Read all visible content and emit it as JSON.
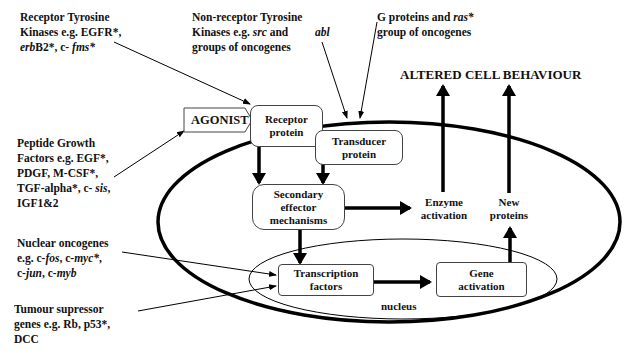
{
  "title": "ALTERED CELL BEHAVIOUR",
  "side_labels": {
    "receptor_tk": {
      "line1": "Receptor Tyrosine",
      "line2": "Kinases e.g. EGFR*,",
      "line3_italic": "erb",
      "line3_rest": "B2*, c- ",
      "line3_italic2": "fms*"
    },
    "non_receptor_tk": {
      "line1": "Non-receptor Tyrosine",
      "line2_a": "Kinases e.g. ",
      "line2_italic": "src",
      "line2_b": " and",
      "line3": "groups of oncogenes",
      "abl": "abl"
    },
    "g_proteins": {
      "line1_a": "G proteins and ",
      "line1_italic": "ras*",
      "line2": "group of oncogenes"
    },
    "peptide_growth": {
      "line1": "Peptide Growth",
      "line2": "Factors e.g. EGF*,",
      "line3": "PDGF, M-CSF*,",
      "line4_a": "TGF-alpha*, c- ",
      "line4_italic": "sis",
      "line4_b": ",",
      "line5": "IGF1&2"
    },
    "nuclear_oncogenes": {
      "line1": "Nuclear oncogenes",
      "line2_a": "e.g. c-",
      "line2_i1": "fos",
      "line2_b": ", c-",
      "line2_i2": "myc*",
      "line2_c": ",",
      "line3_a": "c-",
      "line3_i1": "jun",
      "line3_b": ", c-",
      "line3_i2": "myb"
    },
    "tumour_suppressor": {
      "line1": "Tumour supressor",
      "line2": "genes e.g. Rb, p53*,",
      "line3": "DCC"
    }
  },
  "nodes": {
    "agonist": "AGONIST",
    "receptor_protein": [
      "Receptor",
      "protein"
    ],
    "transducer_protein": [
      "Transducer",
      "protein"
    ],
    "secondary_effector": [
      "Secondary",
      "effector",
      "mechanisms"
    ],
    "enzyme_activation": [
      "Enzyme",
      "activation"
    ],
    "new_proteins": [
      "New",
      "proteins"
    ],
    "transcription_factors": [
      "Transcription",
      "factors"
    ],
    "gene_activation": [
      "Gene",
      "activation"
    ],
    "nucleus": "nucleus"
  },
  "colors": {
    "line": "#000000",
    "box_border": "#444444",
    "background": "#ffffff"
  }
}
